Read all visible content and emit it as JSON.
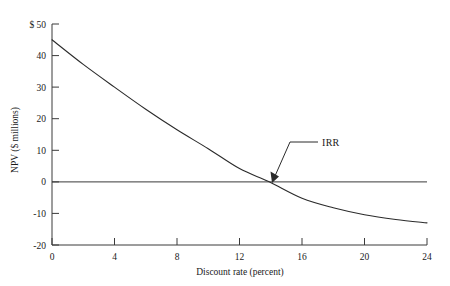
{
  "chart_data": {
    "type": "line",
    "title": "",
    "xlabel": "Discount rate (percent)",
    "ylabel": "NPV ($ millions)",
    "xlim": [
      0,
      24
    ],
    "ylim": [
      -20,
      50
    ],
    "grid": false,
    "legend": "none",
    "x_ticks": [
      "0",
      "4",
      "8",
      "12",
      "16",
      "20",
      "24"
    ],
    "x_tick_values": [
      0,
      4,
      8,
      12,
      16,
      20,
      24
    ],
    "y_ticks": [
      "$ 50",
      "40",
      "30",
      "20",
      "10",
      "0",
      "-10",
      "-20"
    ],
    "y_tick_values": [
      50,
      40,
      30,
      20,
      10,
      0,
      -10,
      -20
    ],
    "series": [
      {
        "name": "NPV profile",
        "x": [
          0,
          2,
          4,
          6,
          8,
          10,
          12,
          13.9,
          16,
          18,
          20,
          22,
          24
        ],
        "values": [
          45,
          37.2,
          30,
          23,
          16.5,
          10.5,
          4.2,
          0,
          -5.2,
          -8.2,
          -10.4,
          -11.9,
          -13.0
        ]
      },
      {
        "name": "zero line",
        "x": [
          0,
          24
        ],
        "values": [
          0,
          0
        ]
      }
    ],
    "annotations": [
      {
        "label": "IRR",
        "point_x": 13.9,
        "point_y": 0,
        "note": "arrow indicating internal rate of return where NPV crosses zero"
      }
    ],
    "colors": {
      "curve": "#2b2b2b",
      "axis": "#3a3a3a",
      "zero_line": "#3a3a3a",
      "background": "#ffffff",
      "text": "#1a1a1a"
    }
  },
  "axes": {
    "y_title": "NPV ($ millions)",
    "x_title": "Discount rate (percent)",
    "y_labels": {
      "t50": "$ 50",
      "t40": "40",
      "t30": "30",
      "t20": "20",
      "t10": "10",
      "t0": "0",
      "tm10": "-10",
      "tm20": "-20"
    },
    "x_labels": {
      "x0": "0",
      "x4": "4",
      "x8": "8",
      "x12": "12",
      "x16": "16",
      "x20": "20",
      "x24": "24"
    }
  },
  "annotation": {
    "irr_label": "IRR"
  }
}
